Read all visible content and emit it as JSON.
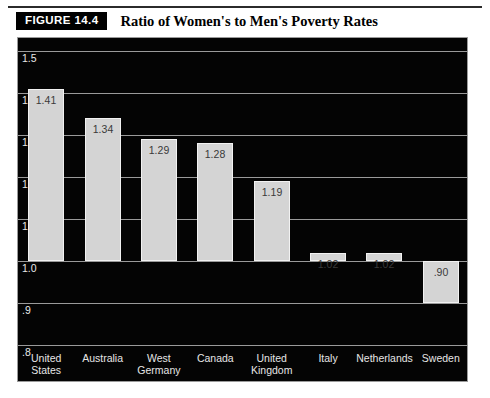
{
  "figure": {
    "badge_label": "FIGURE 14.4",
    "title": "Ratio of Women's to Men's Poverty Rates"
  },
  "colors": {
    "plot_background": "#040404",
    "bar_fill": "#d4d4d4",
    "gridline": "#9a9a9a",
    "axis_text": "#e8e8e8",
    "value_text": "#3a3a3a",
    "badge_background": "#000000",
    "badge_text": "#ffffff"
  },
  "chart_data": {
    "type": "bar",
    "title": "Ratio of Women's to Men's Poverty Rates",
    "xlabel": "",
    "ylabel": "",
    "ylim": [
      0.8,
      1.5
    ],
    "grid": true,
    "legend": "none",
    "ytick_labels": [
      "1.5",
      "1.4",
      "1.3",
      "1.2",
      "1.1",
      "1.0",
      ".9",
      ".8"
    ],
    "ytick_values": [
      1.5,
      1.4,
      1.3,
      1.2,
      1.1,
      1.0,
      0.9,
      0.8
    ],
    "bar_baseline": 1.0,
    "categories": [
      "United\nStates",
      "Australia",
      "West\nGermany",
      "Canada",
      "United\nKingdom",
      "Italy",
      "Netherlands",
      "Sweden"
    ],
    "values": [
      1.41,
      1.34,
      1.29,
      1.28,
      1.19,
      1.02,
      1.02,
      0.9
    ],
    "value_labels": [
      "1.41",
      "1.34",
      "1.29",
      "1.28",
      "1.19",
      "1.02",
      "1.02",
      ".90"
    ]
  }
}
